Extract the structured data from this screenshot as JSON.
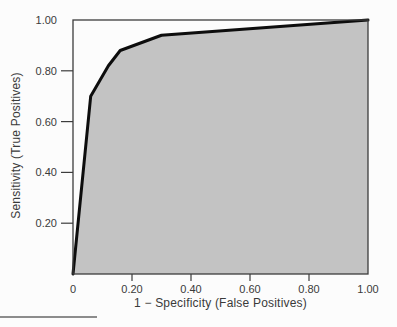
{
  "chart_data": {
    "type": "area",
    "title": "",
    "xlabel": "1 − Specificity (False Positives)",
    "ylabel": "Sensitivity (True Positives)",
    "xlim": [
      0,
      1
    ],
    "ylim": [
      0,
      1
    ],
    "grid": false,
    "legend": "none",
    "x_ticks": [
      {
        "value": 0,
        "label": "0"
      },
      {
        "value": 0.2,
        "label": "0.20"
      },
      {
        "value": 0.4,
        "label": "0.40"
      },
      {
        "value": 0.6,
        "label": "0.60"
      },
      {
        "value": 0.8,
        "label": "0.80"
      },
      {
        "value": 1,
        "label": "1.00"
      }
    ],
    "y_ticks": [
      {
        "value": 0.2,
        "label": "0.20"
      },
      {
        "value": 0.4,
        "label": "0.40"
      },
      {
        "value": 0.6,
        "label": "0.60"
      },
      {
        "value": 0.8,
        "label": "0.80"
      },
      {
        "value": 1,
        "label": "1.00"
      }
    ],
    "series": [
      {
        "name": "ROC curve",
        "points": [
          [
            0,
            0
          ],
          [
            0.06,
            0.7
          ],
          [
            0.09,
            0.76
          ],
          [
            0.12,
            0.82
          ],
          [
            0.16,
            0.88
          ],
          [
            0.3,
            0.94
          ],
          [
            1.0,
            1.0
          ]
        ],
        "area_under_curve_shaded": true
      }
    ],
    "colors": {
      "curve": "#0d0d0d",
      "area_fill": "#c3c3c3",
      "axis": "#3c3c3c",
      "tick_text": "#3a3a3a",
      "background": "#fcfcfc"
    }
  }
}
